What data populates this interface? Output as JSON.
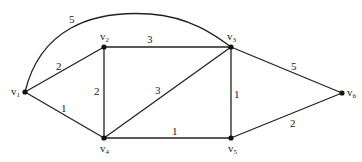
{
  "graph": {
    "type": "weighted-undirected-graph",
    "nodes": [
      {
        "id": "v1",
        "label": "v",
        "sub": "1",
        "x": 25,
        "y": 92
      },
      {
        "id": "v2",
        "label": "v",
        "sub": "2",
        "x": 104,
        "y": 47
      },
      {
        "id": "v3",
        "label": "v",
        "sub": "3",
        "x": 231,
        "y": 47
      },
      {
        "id": "v4",
        "label": "v",
        "sub": "4",
        "x": 104,
        "y": 138
      },
      {
        "id": "v5",
        "label": "v",
        "sub": "5",
        "x": 231,
        "y": 138
      },
      {
        "id": "v6",
        "label": "v",
        "sub": "6",
        "x": 342,
        "y": 93
      }
    ],
    "edges": [
      {
        "from": "v1",
        "to": "v3",
        "weight": "5",
        "curved": true
      },
      {
        "from": "v1",
        "to": "v2",
        "weight": "2"
      },
      {
        "from": "v1",
        "to": "v4",
        "weight": "1"
      },
      {
        "from": "v2",
        "to": "v3",
        "weight": "3"
      },
      {
        "from": "v2",
        "to": "v4",
        "weight": "2"
      },
      {
        "from": "v4",
        "to": "v3",
        "weight": "3"
      },
      {
        "from": "v4",
        "to": "v5",
        "weight": "1"
      },
      {
        "from": "v3",
        "to": "v5",
        "weight": "1"
      },
      {
        "from": "v3",
        "to": "v6",
        "weight": "5"
      },
      {
        "from": "v5",
        "to": "v6",
        "weight": "2"
      }
    ]
  }
}
